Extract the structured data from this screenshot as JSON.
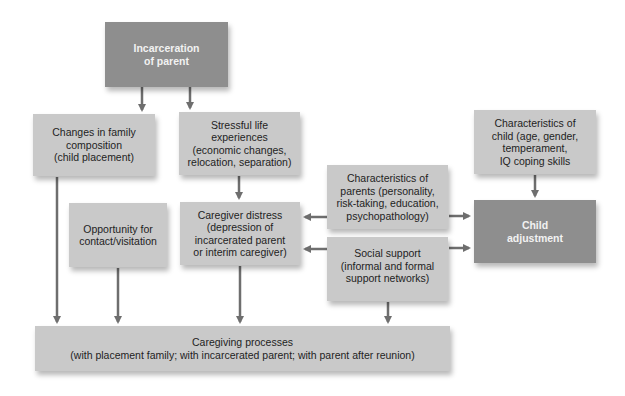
{
  "diagram": {
    "colors": {
      "box_light": "#c9c9c9",
      "box_dark": "#8e8e8e",
      "arrow": "#6e6e6e",
      "text_dark": "#1e1e1e",
      "text_light": "#f2f2f2"
    },
    "nodes": {
      "incarceration": {
        "lines": [
          "Incarceration",
          "of parent"
        ]
      },
      "family_changes": {
        "lines": [
          "Changes in family",
          "composition",
          "(child placement)"
        ]
      },
      "stressful_life": {
        "lines": [
          "Stressful life",
          "experiences",
          "(economic changes,",
          "relocation, separation)"
        ]
      },
      "child_characteristics": {
        "lines": [
          "Characteristics of",
          "child (age, gender,",
          "temperament,",
          "IQ coping skills"
        ]
      },
      "parent_characteristics": {
        "lines": [
          "Characteristics of",
          "parents (personality,",
          "risk-taking, education,",
          "psychopathology)"
        ]
      },
      "opportunity_contact": {
        "lines": [
          "Opportunity for",
          "contact/visitation"
        ]
      },
      "caregiver_distress": {
        "lines": [
          "Caregiver distress",
          "(depression of",
          "incarcerated parent",
          "or interim caregiver)"
        ]
      },
      "social_support": {
        "lines": [
          "Social support",
          "(informal and formal",
          "support networks)"
        ]
      },
      "child_adjustment": {
        "lines": [
          "Child",
          "adjustment"
        ]
      },
      "caregiving_processes": {
        "lines": [
          "Caregiving processes",
          "(with placement family; with incarcerated parent; with parent after reunion)"
        ]
      }
    },
    "edges": [
      {
        "from": "incarceration",
        "to": "family_changes"
      },
      {
        "from": "incarceration",
        "to": "stressful_life"
      },
      {
        "from": "stressful_life",
        "to": "caregiver_distress"
      },
      {
        "from": "family_changes",
        "to": "caregiving_processes"
      },
      {
        "from": "opportunity_contact",
        "to": "caregiving_processes"
      },
      {
        "from": "caregiver_distress",
        "to": "caregiving_processes"
      },
      {
        "from": "social_support",
        "to": "caregiving_processes"
      },
      {
        "from": "parent_characteristics",
        "to": "caregiver_distress"
      },
      {
        "from": "parent_characteristics",
        "to": "child_adjustment"
      },
      {
        "from": "social_support",
        "to": "caregiver_distress"
      },
      {
        "from": "social_support",
        "to": "child_adjustment"
      },
      {
        "from": "child_characteristics",
        "to": "child_adjustment"
      }
    ]
  }
}
